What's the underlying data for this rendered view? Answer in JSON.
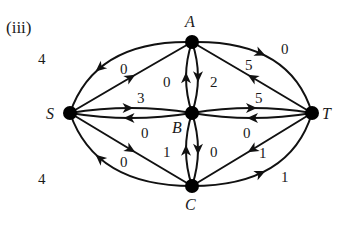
{
  "title": "(iii)",
  "nodes": [
    {
      "id": "S",
      "label": "S"
    },
    {
      "id": "A",
      "label": "A"
    },
    {
      "id": "B",
      "label": "B"
    },
    {
      "id": "C",
      "label": "C"
    },
    {
      "id": "T",
      "label": "T"
    }
  ],
  "edges": [
    {
      "id": "A-S-outer",
      "from": "A",
      "to": "S",
      "value": "4"
    },
    {
      "id": "S-A",
      "from": "S",
      "to": "A",
      "value": "0"
    },
    {
      "id": "S-B",
      "from": "S",
      "to": "B",
      "value": "3"
    },
    {
      "id": "B-S",
      "from": "B",
      "to": "S",
      "value": "0"
    },
    {
      "id": "S-C",
      "from": "S",
      "to": "C",
      "value": "0"
    },
    {
      "id": "C-S-outer",
      "from": "C",
      "to": "S",
      "value": "4"
    },
    {
      "id": "B-A",
      "from": "B",
      "to": "A",
      "value": "0"
    },
    {
      "id": "A-B",
      "from": "A",
      "to": "B",
      "value": "2"
    },
    {
      "id": "C-B",
      "from": "C",
      "to": "B",
      "value": "1"
    },
    {
      "id": "B-C",
      "from": "B",
      "to": "C",
      "value": "0"
    },
    {
      "id": "A-T-outer",
      "from": "A",
      "to": "T",
      "value": "0"
    },
    {
      "id": "T-A",
      "from": "T",
      "to": "A",
      "value": "5"
    },
    {
      "id": "B-T",
      "from": "B",
      "to": "T",
      "value": "5"
    },
    {
      "id": "T-B",
      "from": "T",
      "to": "B",
      "value": "0"
    },
    {
      "id": "T-C",
      "from": "T",
      "to": "C",
      "value": "1"
    },
    {
      "id": "C-T-outer",
      "from": "C",
      "to": "T",
      "value": "1"
    }
  ]
}
